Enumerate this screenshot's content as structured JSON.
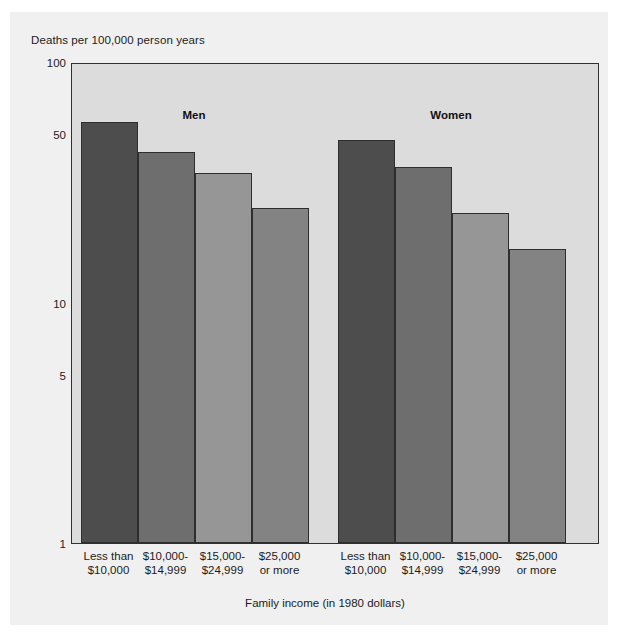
{
  "figure": {
    "background_color": "#f0f0f0",
    "plot_background_color": "#dcdcdc",
    "border_color": "#303030"
  },
  "y_axis_title": "Deaths per 100,000 person years",
  "x_axis_title": "Family income (in 1980 dollars)",
  "group_labels": [
    {
      "label": "Men"
    },
    {
      "label": "Women"
    }
  ],
  "y_ticks": [
    {
      "label": "100",
      "value": 100
    },
    {
      "label": "50",
      "value": 50
    },
    {
      "label": "10",
      "value": 10
    },
    {
      "label": "5",
      "value": 5
    },
    {
      "label": "1",
      "value": 1
    }
  ],
  "category_labels": [
    {
      "line1": "Less than",
      "line2": "$10,000"
    },
    {
      "line1": "$10,000-",
      "line2": "$14,999"
    },
    {
      "line1": "$15,000-",
      "line2": "$24,999"
    },
    {
      "line1": "$25,000",
      "line2": "or more"
    },
    {
      "line1": "Less than",
      "line2": "$10,000"
    },
    {
      "line1": "$10,000-",
      "line2": "$14,999"
    },
    {
      "line1": "$15,000-",
      "line2": "$24,999"
    },
    {
      "line1": "$25,000",
      "line2": "or more"
    }
  ],
  "bar_colors": [
    "#4d4d4d",
    "#6e6e6e",
    "#969696",
    "#838383"
  ],
  "chart_data": {
    "type": "bar",
    "title": "",
    "subtitle": "",
    "xlabel": "Family income (in 1980 dollars)",
    "ylabel": "Deaths per 100,000 person years",
    "yscale": "log",
    "ylim": [
      1,
      100
    ],
    "ytick_values": [
      1,
      5,
      10,
      50,
      100
    ],
    "ytick_labels": [
      "1",
      "5",
      "10",
      "50",
      "100"
    ],
    "grid": false,
    "legend": "none",
    "groups": [
      "Men",
      "Women"
    ],
    "categories": [
      "Less than $10,000",
      "$10,000-$14,999",
      "$15,000-$24,999",
      "$25,000 or more"
    ],
    "series": [
      {
        "name": "Men",
        "values": [
          57,
          43,
          35,
          25
        ]
      },
      {
        "name": "Women",
        "values": [
          48,
          37,
          24,
          17
        ]
      }
    ],
    "bars": [
      {
        "group": "Men",
        "category": "Less than $10,000",
        "value": 57,
        "color": "#4d4d4d"
      },
      {
        "group": "Men",
        "category": "$10,000-$14,999",
        "value": 43,
        "color": "#6e6e6e"
      },
      {
        "group": "Men",
        "category": "$15,000-$24,999",
        "value": 35,
        "color": "#969696"
      },
      {
        "group": "Men",
        "category": "$25,000 or more",
        "value": 25,
        "color": "#838383"
      },
      {
        "group": "Women",
        "category": "Less than $10,000",
        "value": 48,
        "color": "#4d4d4d"
      },
      {
        "group": "Women",
        "category": "$10,000-$14,999",
        "value": 37,
        "color": "#6e6e6e"
      },
      {
        "group": "Women",
        "category": "$15,000-$24,999",
        "value": 24,
        "color": "#969696"
      },
      {
        "group": "Women",
        "category": "$25,000 or more",
        "value": 17,
        "color": "#838383"
      }
    ]
  }
}
